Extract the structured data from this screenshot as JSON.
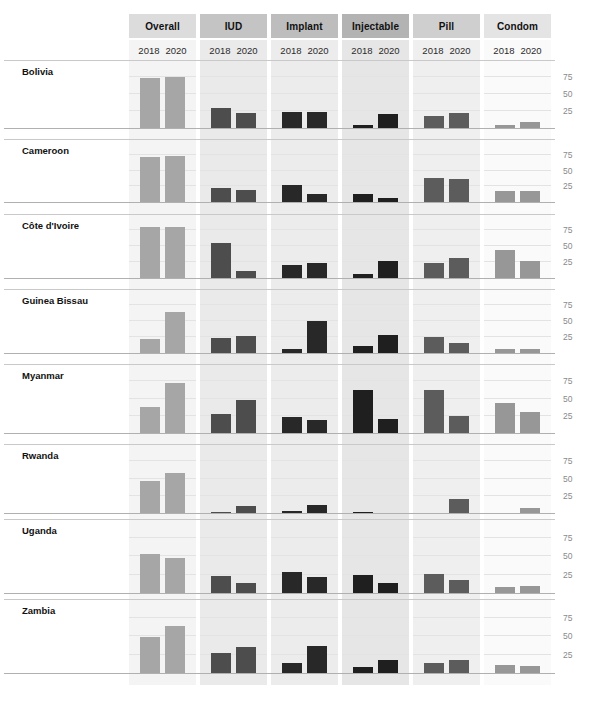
{
  "chart_data": {
    "type": "bar",
    "title": "",
    "subtitle": "",
    "xlabel": "",
    "ylabel": "",
    "ylim": [
      0,
      100
    ],
    "yticks": [
      25,
      50,
      75
    ],
    "grid": true,
    "legend_position": "none",
    "layout": "small-multiples, rows = countries, columns = contraceptive method",
    "panel_columns": [
      "Overall",
      "IUD",
      "Implant",
      "Injectable",
      "Pill",
      "Condom"
    ],
    "panel_header_colors": [
      "#dcdcdc",
      "#c4c4c4",
      "#bdbdbd",
      "#b3b3b3",
      "#cfcfcf",
      "#e4e4e4"
    ],
    "panel_strip_colors": [
      "#f4f4f4",
      "#eaeaea",
      "#ececec",
      "#e6e6e6",
      "#efefef",
      "#fafafa"
    ],
    "panel_bar_colors": [
      "#a6a6a6",
      "#4d4d4d",
      "#282828",
      "#1f1f1f",
      "#5c5c5c",
      "#979797"
    ],
    "series": [
      "2018",
      "2020"
    ],
    "categories": [
      "Bolivia",
      "Cameroon",
      "Côte d'Ivoire",
      "Guinea Bissau",
      "Myanmar",
      "Rwanda",
      "Uganda",
      "Zambia"
    ],
    "values": {
      "Bolivia": {
        "Overall": [
          74,
          75
        ],
        "IUD": [
          30,
          22
        ],
        "Implant": [
          24,
          24
        ],
        "Injectable": [
          5,
          20
        ],
        "Pill": [
          17,
          22
        ],
        "Condom": [
          4,
          9
        ]
      },
      "Cameroon": {
        "Overall": [
          72,
          73
        ],
        "IUD": [
          23,
          19
        ],
        "Implant": [
          27,
          13
        ],
        "Injectable": [
          13,
          7
        ],
        "Pill": [
          38,
          37
        ],
        "Condom": [
          18,
          17
        ]
      },
      "Côte d'Ivoire": {
        "Overall": [
          79,
          80
        ],
        "IUD": [
          55,
          11
        ],
        "Implant": [
          20,
          23
        ],
        "Injectable": [
          6,
          27
        ],
        "Pill": [
          24,
          32
        ],
        "Condom": [
          44,
          27
        ]
      },
      "Guinea Bissau": {
        "Overall": [
          22,
          64
        ],
        "IUD": [
          24,
          26
        ],
        "Implant": [
          7,
          50
        ],
        "Injectable": [
          11,
          28
        ],
        "Pill": [
          25,
          15
        ],
        "Condom": [
          6,
          7
        ]
      },
      "Myanmar": {
        "Overall": [
          37,
          73
        ],
        "IUD": [
          28,
          48
        ],
        "Implant": [
          23,
          19
        ],
        "Injectable": [
          62,
          20
        ],
        "Pill": [
          62,
          24
        ],
        "Condom": [
          44,
          30
        ]
      },
      "Rwanda": {
        "Overall": [
          46,
          58
        ],
        "IUD": [
          2,
          10
        ],
        "Implant": [
          3,
          11
        ],
        "Injectable": [
          1,
          0
        ],
        "Pill": [
          0,
          20
        ],
        "Condom": [
          0,
          7
        ]
      },
      "Uganda": {
        "Overall": [
          53,
          47
        ],
        "IUD": [
          23,
          14
        ],
        "Implant": [
          28,
          22
        ],
        "Injectable": [
          24,
          13
        ],
        "Pill": [
          26,
          17
        ],
        "Condom": [
          8,
          9
        ]
      },
      "Zambia": {
        "Overall": [
          48,
          64
        ],
        "IUD": [
          27,
          35
        ],
        "Implant": [
          13,
          36
        ],
        "Injectable": [
          8,
          17
        ],
        "Pill": [
          14,
          18
        ],
        "Condom": [
          11,
          9
        ]
      }
    }
  },
  "axis": {
    "tick_labels": [
      "75",
      "50",
      "25"
    ]
  },
  "panels": [
    {
      "label": "Overall",
      "years": [
        "2018",
        "2020"
      ]
    },
    {
      "label": "IUD",
      "years": [
        "2018",
        "2020"
      ]
    },
    {
      "label": "Implant",
      "years": [
        "2018",
        "2020"
      ]
    },
    {
      "label": "Injectable",
      "years": [
        "2018",
        "2020"
      ]
    },
    {
      "label": "Pill",
      "years": [
        "2018",
        "2020"
      ]
    },
    {
      "label": "Condom",
      "years": [
        "2018",
        "2020"
      ]
    }
  ],
  "countries": [
    {
      "label": "Bolivia"
    },
    {
      "label": "Cameroon"
    },
    {
      "label": "Côte d'Ivoire"
    },
    {
      "label": "Guinea Bissau"
    },
    {
      "label": "Myanmar"
    },
    {
      "label": "Rwanda"
    },
    {
      "label": "Uganda"
    },
    {
      "label": "Zambia"
    }
  ]
}
